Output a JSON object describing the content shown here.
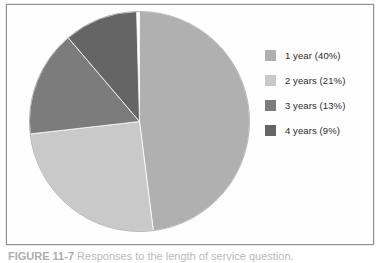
{
  "figure": {
    "background_color": "#ffffff",
    "frame_border_color": "#8d8d8d",
    "caption_number": "FIGURE 11-7",
    "caption_text": "Responses to the length of service question."
  },
  "legend": {
    "position": "right",
    "items": [
      {
        "label": "1 year (40%)",
        "color": "#b0b0b0",
        "swatch_name": "legend-swatch-1-year"
      },
      {
        "label": "2 years (21%)",
        "color": "#c9c9c9",
        "swatch_name": "legend-swatch-2-years"
      },
      {
        "label": "3 years (13%)",
        "color": "#7c7c7c",
        "swatch_name": "legend-swatch-3-years"
      },
      {
        "label": "4 years (9%)",
        "color": "#656565",
        "swatch_name": "legend-swatch-4-years"
      }
    ]
  },
  "chart_data": {
    "type": "pie",
    "title": "",
    "xlabel": "",
    "ylabel": "",
    "legend_position": "right",
    "grid": false,
    "start_angle_deg": 0,
    "direction": "clockwise",
    "categories": [
      "1 year",
      "2 years",
      "3 years",
      "4 years"
    ],
    "values": [
      40,
      21,
      13,
      9
    ],
    "value_unit": "%",
    "labels": [
      "1 year (40%)",
      "2 years (21%)",
      "3 years (13%)",
      "4 years (9%)"
    ],
    "colors": [
      "#b0b0b0",
      "#c9c9c9",
      "#7c7c7c",
      "#656565"
    ],
    "slice_sweep_deg": [
      172.8,
      90.7,
      56.1,
      38.9
    ],
    "slices": [
      {
        "name": "1 year",
        "value": 40,
        "percent_label": "40%",
        "color": "#b0b0b0",
        "start_deg": 0.0,
        "end_deg": 172.8
      },
      {
        "name": "2 years",
        "value": 21,
        "percent_label": "21%",
        "color": "#c9c9c9",
        "start_deg": 172.8,
        "end_deg": 263.5
      },
      {
        "name": "3 years",
        "value": 13,
        "percent_label": "13%",
        "color": "#7c7c7c",
        "start_deg": 263.5,
        "end_deg": 319.6
      },
      {
        "name": "4 years",
        "value": 9,
        "percent_label": "9%",
        "color": "#656565",
        "start_deg": 319.6,
        "end_deg": 358.5
      }
    ]
  }
}
